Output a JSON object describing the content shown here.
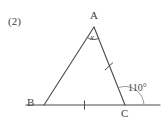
{
  "figure": {
    "problem_number": "(2)",
    "type": "geometry-diagram",
    "shape": "triangle",
    "stroke_color": "#4a4a4a",
    "background_color": "#ffffff",
    "vertices": [
      {
        "name": "A",
        "label": "A",
        "x": 94,
        "y": 27
      },
      {
        "name": "B",
        "label": "B",
        "x": 44,
        "y": 105
      },
      {
        "name": "C",
        "label": "C",
        "x": 125,
        "y": 105
      }
    ],
    "extension_line": {
      "name": "BC-extended",
      "from_x": 26,
      "to_x": 160,
      "y": 105
    },
    "angles": [
      {
        "at": "A",
        "label": "x",
        "marker": "arc",
        "unknown": true
      },
      {
        "at": "C",
        "label": "110°",
        "marker": "arc",
        "value": 110,
        "kind": "exterior"
      }
    ],
    "tick_marks": [
      {
        "on_segment": "BC",
        "count": 1
      },
      {
        "on_segment": "AC",
        "count": 1
      }
    ]
  }
}
